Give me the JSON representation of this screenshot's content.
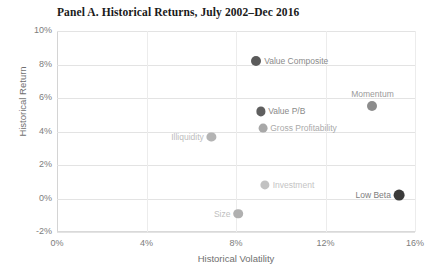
{
  "chart_data": {
    "type": "scatter",
    "title": "Panel A. Historical Returns, July 2002–Dec 2016",
    "xlabel": "Historical Volatility",
    "ylabel": "Historical Return",
    "xlim": [
      0,
      16
    ],
    "ylim": [
      -2,
      10
    ],
    "xticks": [
      "0%",
      "4%",
      "8%",
      "12%",
      "16%"
    ],
    "xtick_values": [
      0,
      4,
      8,
      12,
      16
    ],
    "yticks": [
      "10%",
      "8%",
      "6%",
      "4%",
      "2%",
      "0%",
      "-2%"
    ],
    "ytick_values": [
      10,
      8,
      6,
      4,
      2,
      0,
      -2
    ],
    "grid": "horizontal-and-vertical",
    "legend": "none",
    "points": [
      {
        "name": "Value Composite",
        "x": 8.9,
        "y": 8.2,
        "color": "#5a5a5a",
        "radius": 5.0,
        "label_pos": "right",
        "label_color": "#8a8a8a"
      },
      {
        "name": "Momentum",
        "x": 14.1,
        "y": 5.5,
        "color": "#8c8c8c",
        "radius": 5.0,
        "label_pos": "above",
        "label_color": "#9a9a9a"
      },
      {
        "name": "Value P/B",
        "x": 9.1,
        "y": 5.2,
        "color": "#5f5f5f",
        "radius": 4.6,
        "label_pos": "right",
        "label_color": "#8a8a8a"
      },
      {
        "name": "Gross Profitability",
        "x": 9.2,
        "y": 4.2,
        "color": "#a8a8a8",
        "radius": 4.4,
        "label_pos": "right",
        "label_color": "#aaaaaa"
      },
      {
        "name": "Illiquidity",
        "x": 6.9,
        "y": 3.7,
        "color": "#b4b4b4",
        "radius": 4.6,
        "label_pos": "left",
        "label_color": "#bdbdbd"
      },
      {
        "name": "Investment",
        "x": 9.3,
        "y": 0.8,
        "color": "#c2c2c2",
        "radius": 4.6,
        "label_pos": "right",
        "label_color": "#c4c4c4"
      },
      {
        "name": "Low Beta",
        "x": 15.3,
        "y": 0.2,
        "color": "#3a3a3a",
        "radius": 5.4,
        "label_pos": "left",
        "label_color": "#7d7d7d"
      },
      {
        "name": "Size",
        "x": 8.1,
        "y": -0.9,
        "color": "#b0b0b0",
        "radius": 4.8,
        "label_pos": "left",
        "label_color": "#c0c0c0"
      }
    ]
  }
}
